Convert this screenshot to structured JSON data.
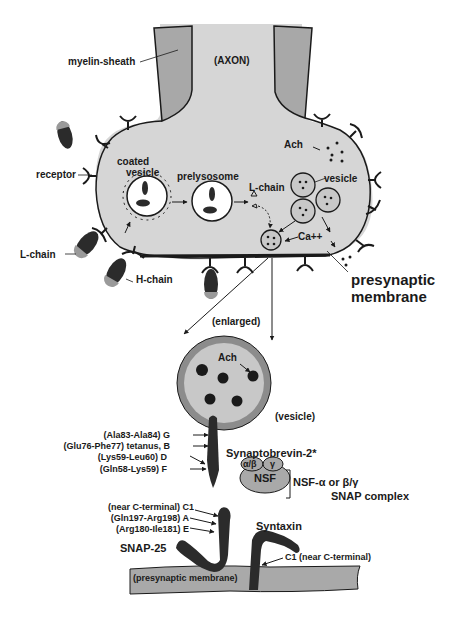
{
  "diagram": {
    "colors": {
      "cytoplasm": "#d6d6d6",
      "myelin": "#a8a8a8",
      "toxin_dark": "#2b2b2b",
      "toxin_tip": "#9a9a9a",
      "membrane_strip": "#a9a9a9",
      "vesicle_outer": "#8c8c8c",
      "vesicle_inner": "#c8c8c8",
      "nsf": "#a9a9a9",
      "line": "#1a1a1a"
    },
    "terminal": {
      "myelin_sheath": "myelin-sheath",
      "axon": "(AXON)",
      "receptor": "receptor",
      "coated_vesicle_1": "coated",
      "coated_vesicle_2": "vesicle",
      "prelysosome": "prelysosome",
      "l_chain_inside": "L-chain",
      "ach": "Ach",
      "vesicle": "vesicle",
      "calcium": "Ca++",
      "l_chain_outside": "L-chain",
      "h_chain": "H-chain",
      "presynaptic_membrane_1": "presynaptic",
      "presynaptic_membrane_2": "membrane"
    },
    "enlarged": {
      "label": "(enlarged)",
      "ach": "Ach",
      "vesicle": "(vesicle)",
      "synaptobrevin": "Synaptobrevin-2*",
      "synaptobrevin_sites": [
        {
          "site": "(Ala83-Ala84)",
          "toxin": "G"
        },
        {
          "site": "(Glu76-Phe77)",
          "toxin": "tetanus, B"
        },
        {
          "site": "(Lys59-Leu60)",
          "toxin": "D"
        },
        {
          "site": "(Gln58-Lys59)",
          "toxin": "F"
        }
      ],
      "snap25_sites": [
        {
          "site": "(near C-terminal)",
          "toxin": "C1"
        },
        {
          "site": "(Gln197-Arg198)",
          "toxin": "A"
        },
        {
          "site": "(Arg180-Ile181)",
          "toxin": "E"
        }
      ],
      "snap25": "SNAP-25",
      "syntaxin": "Syntaxin",
      "syntaxin_site": "C1 (near C-terminal)",
      "nsf": "NSF",
      "alpha_beta": "α/β",
      "gamma": "γ",
      "nsf_complex_1": "NSF-α or β/γ",
      "nsf_complex_2": "SNAP complex",
      "membrane": "(presynaptic membrane)"
    }
  }
}
